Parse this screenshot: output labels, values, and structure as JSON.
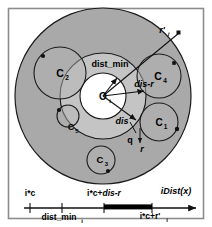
{
  "figure": {
    "name": "idist-pruning-diagram",
    "background": "#ffffff",
    "border_color": "#8c8c8c",
    "colors": {
      "outer_disk": "#a9a9a9",
      "mid_ring": "#c0c0c0",
      "inner_disk": "#ffffff",
      "cluster_fill": "#b4b4b4",
      "stroke": "#1a1a1a",
      "bar": "#000000"
    }
  },
  "circles": [
    {
      "id": "C2",
      "label": "C",
      "sub": "2",
      "cx": 60,
      "cy": 73,
      "r": 26,
      "dot_x": 43,
      "dot_y": 56
    },
    {
      "id": "C4",
      "label": "C",
      "sub": "4",
      "cx": 159,
      "cy": 76,
      "r": 22,
      "dot_x": 174,
      "dot_y": 63
    },
    {
      "id": "C1",
      "label": "C",
      "sub": "1",
      "cx": 159,
      "cy": 122,
      "r": 19,
      "dot_x": 176,
      "dot_y": 130
    },
    {
      "id": "C5",
      "label": "C",
      "sub": "5",
      "cx": 68,
      "cy": 116,
      "r": 11,
      "dot_x": 59,
      "dot_y": 110
    },
    {
      "id": "C3",
      "label": "C",
      "sub": "3",
      "cx": 101,
      "cy": 160,
      "r": 14,
      "dot_x": 107,
      "dot_y": 171
    }
  ],
  "center": {
    "label": "O",
    "sub": "i",
    "cx": 103,
    "cy": 96
  },
  "radii": {
    "outer": 88,
    "mid": 43,
    "inner": 23
  },
  "annotations": {
    "dist_min": "dist_min",
    "dis_minus_r": "dis-r",
    "dis": "dis",
    "r_prime_i": "r'",
    "r_prime_i_sub": "i",
    "q": "q",
    "r": "r"
  },
  "axis": {
    "label_right": "iDist(x)",
    "label_left": "i*c",
    "label_mid_top": "i*c+dis-r",
    "label_mid_top_plain": "i*c+",
    "label_mid_top_italic": "dis-r",
    "label_below_left": "dist_min",
    "label_below_left_sub": "i",
    "label_below_right": "i*c+r'",
    "label_below_right_sub": "i",
    "ticks": [
      30,
      62,
      104,
      152
    ],
    "bar_start": 104,
    "bar_end": 152,
    "axis_y": 208,
    "axis_x_start": 24,
    "axis_x_end": 196
  }
}
